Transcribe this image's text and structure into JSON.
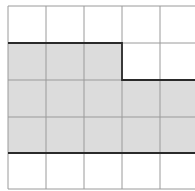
{
  "diagram": {
    "type": "grid-area-figure",
    "grid": {
      "columns_visible": 5,
      "rows": 5,
      "x_lines": [
        8,
        46,
        84,
        122,
        160,
        198
      ],
      "y_lines": [
        6,
        43,
        80,
        117,
        153,
        189
      ],
      "line_color": "#9a9a9a"
    },
    "shaded_region": {
      "fill": "#dcdcdc",
      "outline_color": "#2a2a2a",
      "cells": [
        {
          "row": 1,
          "col": 0
        },
        {
          "row": 1,
          "col": 1
        },
        {
          "row": 1,
          "col": 2
        },
        {
          "row": 2,
          "col": 0
        },
        {
          "row": 2,
          "col": 1
        },
        {
          "row": 2,
          "col": 2
        },
        {
          "row": 2,
          "col": 3
        },
        {
          "row": 2,
          "col": 4
        },
        {
          "row": 3,
          "col": 0
        },
        {
          "row": 3,
          "col": 1
        },
        {
          "row": 3,
          "col": 2
        },
        {
          "row": 3,
          "col": 3
        },
        {
          "row": 3,
          "col": 4
        }
      ],
      "outline_points": "8,43 122,43 122,80 198,80 198,153 8,153"
    }
  }
}
